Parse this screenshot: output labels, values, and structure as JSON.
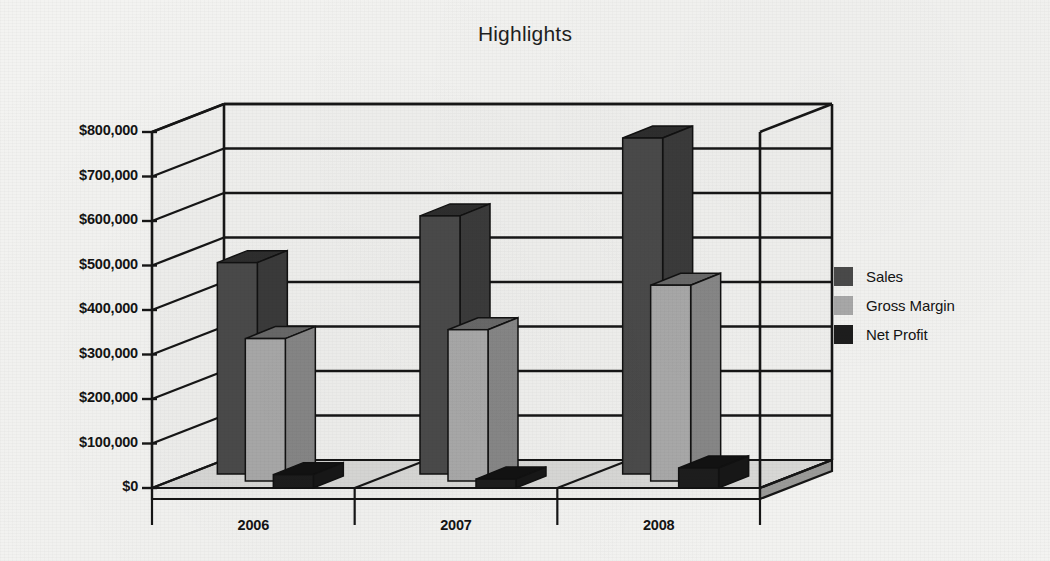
{
  "chart_data": {
    "type": "bar",
    "title": "Highlights",
    "xlabel": "",
    "ylabel": "",
    "categories": [
      "2006",
      "2007",
      "2008"
    ],
    "series": [
      {
        "name": "Sales",
        "color": "#4a4a4a",
        "values": [
          475000,
          580000,
          755000
        ]
      },
      {
        "name": "Gross Margin",
        "color": "#a9a9a9",
        "values": [
          320000,
          340000,
          440000
        ]
      },
      {
        "name": "Net Profit",
        "color": "#1d1d1d",
        "values": [
          30000,
          20000,
          45000
        ]
      }
    ],
    "ylim": [
      0,
      800000
    ],
    "ytick_values": [
      0,
      100000,
      200000,
      300000,
      400000,
      500000,
      600000,
      700000,
      800000
    ],
    "ytick_labels": [
      "$0",
      "$100,000",
      "$200,000",
      "$300,000",
      "$400,000",
      "$500,000",
      "$600,000",
      "$700,000",
      "$800,000"
    ],
    "grid": true,
    "legend_position": "right",
    "three_d": true
  },
  "legend": {
    "items": [
      {
        "label": "Sales",
        "color": "#4a4a4a"
      },
      {
        "label": "Gross Margin",
        "color": "#a9a9a9"
      },
      {
        "label": "Net Profit",
        "color": "#1d1d1d"
      }
    ]
  },
  "colors": {
    "background": "#f3f3f1",
    "axis": "#161616",
    "floor": "#8f8f8f",
    "wall": "#f0f0ee"
  }
}
